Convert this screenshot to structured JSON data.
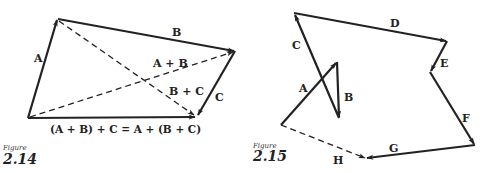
{
  "figures": [
    {
      "caption_word": "Figure",
      "number": "2.14",
      "vectors": [
        {
          "label": "A",
          "style": "solid"
        },
        {
          "label": "B",
          "style": "solid"
        },
        {
          "label": "C",
          "style": "solid"
        },
        {
          "label": "A + B",
          "style": "dashed"
        },
        {
          "label": "B + C",
          "style": "dashed"
        }
      ],
      "equation": "(A + B) + C = A + (B + C)"
    },
    {
      "caption_word": "Figure",
      "number": "2.15",
      "vectors": [
        {
          "label": "A",
          "style": "solid"
        },
        {
          "label": "B",
          "style": "solid"
        },
        {
          "label": "C",
          "style": "solid"
        },
        {
          "label": "D",
          "style": "solid"
        },
        {
          "label": "E",
          "style": "solid"
        },
        {
          "label": "F",
          "style": "solid"
        },
        {
          "label": "G",
          "style": "solid"
        },
        {
          "label": "H",
          "style": "dashed"
        }
      ]
    }
  ],
  "colors": {
    "ink": "#222222",
    "background": "#ffffff"
  }
}
